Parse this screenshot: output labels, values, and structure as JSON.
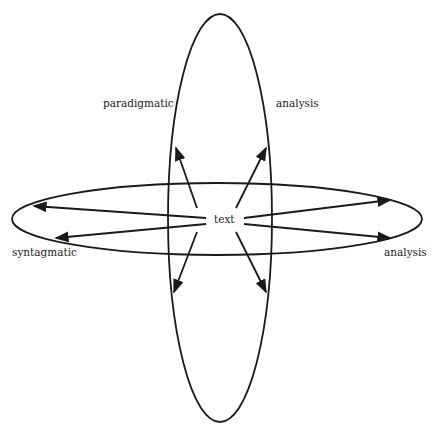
{
  "diagram": {
    "center_label": "text",
    "labels": {
      "top_left": "paradigmatic",
      "top_right": "analysis",
      "bottom_left": "syntagmatic",
      "bottom_right": "analysis"
    },
    "ellipses": [
      {
        "name": "paradigmatic-axis",
        "orientation": "vertical",
        "cx": 220,
        "cy": 218,
        "rx": 52,
        "ry": 204
      },
      {
        "name": "syntagmatic-axis",
        "orientation": "horizontal",
        "cx": 217,
        "cy": 219,
        "rx": 205,
        "ry": 36
      }
    ],
    "arrows": [
      {
        "direction": "up-left",
        "from": [
          197,
          208
        ],
        "to": [
          176,
          148
        ]
      },
      {
        "direction": "up-right",
        "from": [
          236,
          208
        ],
        "to": [
          266,
          148
        ]
      },
      {
        "direction": "down-left",
        "from": [
          197,
          232
        ],
        "to": [
          174,
          292
        ]
      },
      {
        "direction": "down-right",
        "from": [
          236,
          232
        ],
        "to": [
          266,
          292
        ]
      },
      {
        "direction": "left-upper",
        "from": [
          206,
          218
        ],
        "to": [
          34,
          206
        ]
      },
      {
        "direction": "left-lower",
        "from": [
          206,
          224
        ],
        "to": [
          56,
          238
        ]
      },
      {
        "direction": "right-upper",
        "from": [
          244,
          218
        ],
        "to": [
          390,
          200
        ]
      },
      {
        "direction": "right-lower",
        "from": [
          244,
          224
        ],
        "to": [
          390,
          238
        ]
      }
    ],
    "colors": {
      "stroke": "#1a1a1a",
      "background": "#ffffff"
    }
  }
}
